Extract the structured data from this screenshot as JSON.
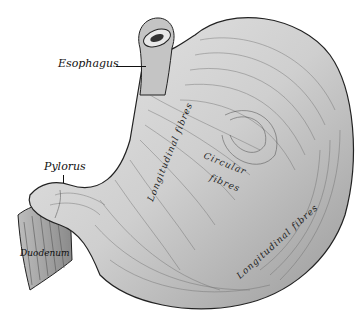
{
  "figure": {
    "colors": {
      "ink": "#111111",
      "fill": "#d8d8d8",
      "shade": "#7a7a7a",
      "background": "#ffffff"
    }
  },
  "labels": {
    "esophagus": "Esophagus",
    "pylorus": "Pylorus",
    "duodenum": "Duodenum",
    "longitudinal_upper": "Longitudinal fibres",
    "circular_1": "Circular",
    "circular_2": "fibres",
    "longitudinal_lower": "Longitudinal fibres"
  }
}
